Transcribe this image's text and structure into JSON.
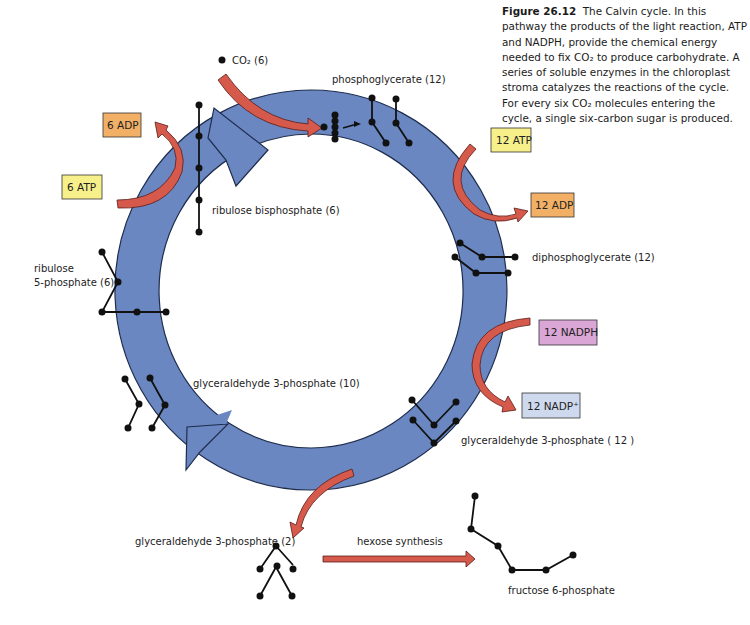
{
  "figure": {
    "number_label": "Figure 26.12",
    "caption_text": "The Calvin cycle. In this pathway the products of the light reaction, ATP and NADPH, provide the chemical energy needed to fix CO₂ to produce carbohydrate. A series of soluble enzymes in the chloroplast stroma catalyzes the reactions of the cycle. For every six CO₂ molecules entering the cycle, a single six-carbon sugar is produced."
  },
  "labels": {
    "co2": "CO₂ (6)",
    "phosphoglycerate": "phosphoglycerate (12)",
    "diphosphoglycerate": "diphosphoglycerate  (12)",
    "g3p_12": "glyceraldehyde 3-phosphate  ( 12 )",
    "g3p_10": "glyceraldehyde 3-phosphate  (10)",
    "g3p_2": "glyceraldehyde 3-phosphate  (2)",
    "ribulose_bisphosphate": "ribulose bisphosphate  (6)",
    "ribulose_5p_line1": "ribulose",
    "ribulose_5p_line2": "5-phosphate  (6)",
    "hexose_synthesis": "hexose synthesis",
    "fructose_6p": "fructose 6-phosphate"
  },
  "boxes": {
    "adp6": {
      "label": "6 ADP",
      "color": "#f2b066"
    },
    "atp6": {
      "label": "6 ATP",
      "color": "#f7f08a"
    },
    "atp12": {
      "label": "12 ATP",
      "color": "#f7f08a"
    },
    "adp12": {
      "label": "12 ADP",
      "color": "#f2b066"
    },
    "nadph12": {
      "label": "12 NADPH",
      "color": "#d9a6d6"
    },
    "nadp12": {
      "label": "12 NADP⁺",
      "color": "#cfd9ee"
    }
  },
  "colors": {
    "cycle_ring": "#6a87c2",
    "cycle_outline": "#1f2d4d",
    "flow_arrow": "#d55a4c",
    "molecule": "#111111"
  }
}
